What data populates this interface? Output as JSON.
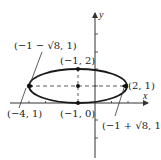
{
  "figure": {
    "type": "ellipse-diagram",
    "axes": {
      "x_label": "x",
      "y_label": "y"
    },
    "ellipse": {
      "center": [
        -1,
        1
      ],
      "semi_major": 3,
      "semi_minor": 1,
      "stroke": "#1a1a1a"
    },
    "labels": {
      "top": "(−1, 2)",
      "bottom": "(−1, 0)",
      "left_vertex": "(−4, 1)",
      "right_vertex": "(2, 1)",
      "left_focus": "(−1 − √8, 1)",
      "right_focus": "(−1 + √8, 1)"
    },
    "points": [
      {
        "name": "top",
        "coord": [
          -1,
          2
        ]
      },
      {
        "name": "center",
        "coord": [
          -1,
          1
        ]
      },
      {
        "name": "bottom",
        "coord": [
          -1,
          0
        ]
      },
      {
        "name": "left-vertex",
        "coord": [
          -4,
          1
        ]
      },
      {
        "name": "right-vertex",
        "coord": [
          2,
          1
        ]
      },
      {
        "name": "left-focus",
        "coord": [
          -3.83,
          1
        ]
      },
      {
        "name": "right-focus",
        "coord": [
          1.83,
          1
        ]
      }
    ]
  }
}
